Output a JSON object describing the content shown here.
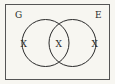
{
  "diagram": {
    "type": "venn",
    "sets": [
      {
        "label": "G"
      },
      {
        "label": "E"
      }
    ],
    "regions": {
      "g_only": "X",
      "intersection": "X",
      "e_only": "X"
    },
    "colors": {
      "background": "#f7f6f1",
      "stroke": "#2a2a2a"
    }
  }
}
